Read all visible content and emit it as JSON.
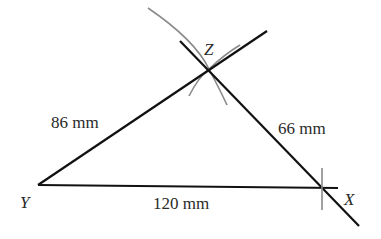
{
  "diagram": {
    "vertices": {
      "Y": {
        "label": "Y",
        "x": 38,
        "y": 185
      },
      "X": {
        "label": "X",
        "x": 323,
        "y": 188
      },
      "Z": {
        "label": "Z",
        "x": 209,
        "y": 69
      }
    },
    "sides": {
      "YX": {
        "label": "120 mm"
      },
      "YZ": {
        "label": "86 mm"
      },
      "ZX": {
        "label": "66 mm"
      }
    },
    "colors": {
      "line": "#111111",
      "arc": "#8a8a8a",
      "text": "#2a2a2a"
    }
  }
}
